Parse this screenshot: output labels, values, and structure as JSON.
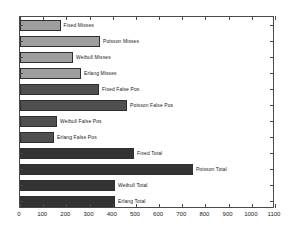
{
  "chart_data": {
    "type": "bar",
    "orientation": "horizontal",
    "title": "",
    "xlabel": "",
    "ylabel": "",
    "xlim": [
      0,
      1100
    ],
    "xticks": [
      0,
      100,
      200,
      300,
      400,
      500,
      600,
      700,
      800,
      900,
      1000,
      1100
    ],
    "xtick_labels": [
      "0",
      "100",
      "200",
      "300",
      "400",
      "500",
      "600",
      "700",
      "800",
      "900",
      "1000",
      "1100"
    ],
    "grid": false,
    "legend": "none",
    "categories": [
      "Fixed Misses",
      "Poisson Misses",
      "Weibull Misses",
      "Erlang Misses",
      "Fixed False Pos",
      "Poisson False Pos",
      "Weibull False Pos",
      "Erlang False Pos",
      "Fixed Total",
      "Poisson Total",
      "Weibull Total",
      "Erlang Total"
    ],
    "values": [
      175,
      345,
      229,
      263,
      341,
      462,
      160,
      147,
      492,
      746,
      410,
      410
    ],
    "bar_colors": [
      "#9e9e9e",
      "#9e9e9e",
      "#9e9e9e",
      "#9e9e9e",
      "#4f4f4f",
      "#4f4f4f",
      "#4f4f4f",
      "#4f4f4f",
      "#333333",
      "#333333",
      "#333333",
      "#333333"
    ],
    "series_groups": [
      {
        "name": "Misses",
        "color": "#9e9e9e"
      },
      {
        "name": "False Pos",
        "color": "#4f4f4f"
      },
      {
        "name": "Total",
        "color": "#333333"
      }
    ]
  },
  "axis": {
    "frame_color": "#4a4a4a",
    "text_color": "#1a1a1a"
  }
}
